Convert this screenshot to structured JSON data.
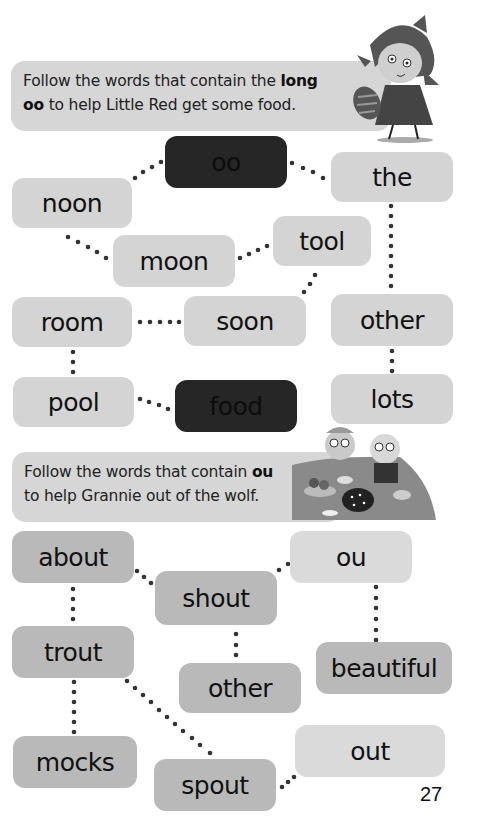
{
  "puzzle1": {
    "instruction_part1": "Follow the words that contain the ",
    "instruction_bold1": "long",
    "instruction_bold2": "oo",
    "instruction_part2": " to help Little Red get some food.",
    "start_word": "oo",
    "end_word": "food",
    "words": {
      "oo": "oo",
      "the": "the",
      "noon": "noon",
      "tool": "tool",
      "moon": "moon",
      "room": "room",
      "soon": "soon",
      "other": "other",
      "pool": "pool",
      "food": "food",
      "lots": "lots"
    },
    "illustration": "little-red-riding-hood-with-basket"
  },
  "puzzle2": {
    "instruction_part1": "Follow the words that contain ",
    "instruction_bold": "ou",
    "instruction_part2": "to help Grannie out of the wolf.",
    "start_word": "ou",
    "end_word": "out",
    "words": {
      "about": "about",
      "ou": "ou",
      "shout": "shout",
      "trout": "trout",
      "beautiful": "beautiful",
      "other": "other",
      "mocks": "mocks",
      "out": "out",
      "spout": "spout"
    },
    "illustration": "grannie-and-wolf-tea-party"
  },
  "page_number": "27",
  "colors": {
    "box_light": "#d4d4d4",
    "box_mid": "#b9b9b9",
    "box_dark": "#262626",
    "dots": "#333333"
  }
}
